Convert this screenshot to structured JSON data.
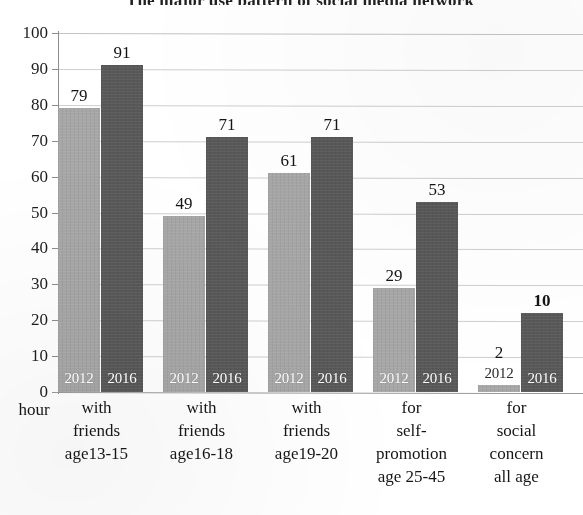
{
  "chart_data": {
    "type": "bar",
    "title": "The major use pattern of social media network",
    "xlabel": "",
    "ylabel": "hour",
    "ylim": [
      0,
      100
    ],
    "ytick_step": 10,
    "yticks": [
      "100",
      "90",
      "80",
      "70",
      "60",
      "50",
      "40",
      "30",
      "20",
      "10",
      "0"
    ],
    "grid": true,
    "legend_position": "none",
    "categories": [
      "with friends age13-15",
      "with friends age16-18",
      "with friends age19-20",
      "for self-promotion age 25-45",
      "for social concern all age"
    ],
    "category_lines": [
      [
        "with",
        "friends",
        "age13-15"
      ],
      [
        "with",
        "friends",
        "age16-18"
      ],
      [
        "with",
        "friends",
        "age19-20"
      ],
      [
        "for",
        "self-",
        "promotion",
        "age 25-45"
      ],
      [
        "for",
        "social",
        "concern",
        "all age"
      ]
    ],
    "series": [
      {
        "name": "2012",
        "color": "#a6a6a6",
        "values": [
          79,
          49,
          61,
          29,
          2
        ],
        "labels": [
          "79",
          "49",
          "61",
          "29",
          "2"
        ]
      },
      {
        "name": "2016",
        "color": "#585858",
        "values": [
          91,
          71,
          71,
          53,
          22
        ],
        "labels": [
          "91",
          "71",
          "71",
          "53",
          "10"
        ],
        "label_bold": [
          false,
          false,
          false,
          false,
          true
        ]
      }
    ],
    "axis_unit_label": "hour"
  },
  "series_names": {
    "s2012": "2012",
    "s2016": "2016"
  }
}
